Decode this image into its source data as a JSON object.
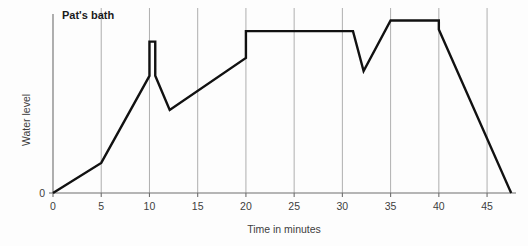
{
  "chart_data": {
    "type": "line",
    "title": "Pat's bath",
    "xlabel": "Time in minutes",
    "ylabel": "Water level",
    "xlim": [
      0,
      48
    ],
    "ylim": [
      0,
      10
    ],
    "xticks": [
      0,
      5,
      10,
      15,
      20,
      25,
      30,
      35,
      40,
      45
    ],
    "xtick_labels": [
      "0",
      "5",
      "10",
      "15",
      "20",
      "25",
      "30",
      "35",
      "40",
      "45"
    ],
    "yticks": [
      0
    ],
    "ytick_labels": [
      "0"
    ],
    "grid": "vertical",
    "legend": "none",
    "series": [
      {
        "name": "Water level",
        "color": "#111111",
        "points": [
          {
            "x": 0,
            "y": 0
          },
          {
            "x": 5,
            "y": 1.85
          },
          {
            "x": 10,
            "y": 7.2
          },
          {
            "x": 10,
            "y": 9.3
          },
          {
            "x": 10.6,
            "y": 9.3
          },
          {
            "x": 10.6,
            "y": 7.2
          },
          {
            "x": 12.1,
            "y": 5.1
          },
          {
            "x": 20,
            "y": 8.3
          },
          {
            "x": 20,
            "y": 9.95
          },
          {
            "x": 31.1,
            "y": 9.95
          },
          {
            "x": 32.2,
            "y": 7.5
          },
          {
            "x": 35,
            "y": 10.6
          },
          {
            "x": 40,
            "y": 10.6
          },
          {
            "x": 40,
            "y": 10.05
          },
          {
            "x": 47.5,
            "y": 0
          }
        ]
      }
    ]
  },
  "axis_label_color": "#3d3d3d"
}
